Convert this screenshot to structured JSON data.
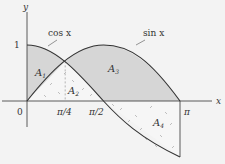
{
  "diagram": {
    "axes": {
      "x_label": "x",
      "y_label": "y"
    },
    "ticks": {
      "y_one": "1",
      "origin": "0",
      "pi_4": "π/4",
      "pi_2": "π/2",
      "pi": "π"
    },
    "curves": {
      "cos_label": "cos x",
      "sin_label": "sin x"
    },
    "regions": {
      "a1_main": "A",
      "a1_sub": "1",
      "a2_main": "A",
      "a2_sub": "2",
      "a3_main": "A",
      "a3_sub": "3",
      "a4_main": "A",
      "a4_sub": "4"
    },
    "colors": {
      "fill": "#d6d6d6",
      "line": "#333333",
      "background": "#f3f3f3"
    }
  }
}
